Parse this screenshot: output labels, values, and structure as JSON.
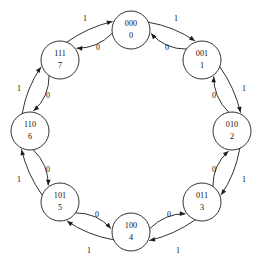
{
  "diagram": {
    "type": "state-transition-diagram",
    "layout": "ring",
    "background_color": "#ffffff",
    "stroke_color": "#1a1a1a",
    "text_color": "#111111",
    "states": [
      {
        "id": "s0",
        "binary": "000",
        "decimal": "0",
        "cx": 131,
        "cy": 30,
        "r": 19
      },
      {
        "id": "s1",
        "binary": "001",
        "decimal": "1",
        "cx": 202,
        "cy": 60,
        "r": 19
      },
      {
        "id": "s2",
        "binary": "010",
        "decimal": "2",
        "cx": 232,
        "cy": 131,
        "r": 19
      },
      {
        "id": "s3",
        "binary": "011",
        "decimal": "3",
        "cx": 202,
        "cy": 202,
        "r": 19
      },
      {
        "id": "s4",
        "binary": "100",
        "decimal": "4",
        "cx": 131,
        "cy": 232,
        "r": 19
      },
      {
        "id": "s5",
        "binary": "101",
        "decimal": "5",
        "cx": 60,
        "cy": 202,
        "r": 19
      },
      {
        "id": "s6",
        "binary": "110",
        "decimal": "6",
        "cx": 30,
        "cy": 131,
        "r": 19
      },
      {
        "id": "s7",
        "binary": "111",
        "decimal": "7",
        "cx": 60,
        "cy": 60,
        "r": 19
      }
    ],
    "transitions": [
      {
        "id": "t0",
        "from": "000",
        "to": "001",
        "input": "1",
        "direction": "clockwise",
        "arc": "outer",
        "label_x": 176,
        "label_y": 19
      },
      {
        "id": "t1",
        "from": "001",
        "to": "010",
        "input": "1",
        "direction": "clockwise",
        "arc": "outer",
        "label_x": 244,
        "label_y": 89
      },
      {
        "id": "t2",
        "from": "010",
        "to": "011",
        "input": "1",
        "direction": "clockwise",
        "arc": "outer",
        "label_x": 244,
        "label_y": 180
      },
      {
        "id": "t3",
        "from": "011",
        "to": "100",
        "input": "1",
        "direction": "clockwise",
        "arc": "outer",
        "label_x": 178,
        "label_y": 251
      },
      {
        "id": "t4",
        "from": "100",
        "to": "101",
        "input": "1",
        "direction": "clockwise",
        "arc": "outer",
        "label_x": 89,
        "label_y": 251
      },
      {
        "id": "t5",
        "from": "101",
        "to": "110",
        "input": "1",
        "direction": "clockwise",
        "arc": "outer",
        "label_x": 19,
        "label_y": 180
      },
      {
        "id": "t6",
        "from": "110",
        "to": "111",
        "input": "1",
        "direction": "clockwise",
        "arc": "outer",
        "label_x": 19,
        "label_y": 89
      },
      {
        "id": "t7",
        "from": "111",
        "to": "000",
        "input": "1",
        "direction": "clockwise",
        "arc": "outer",
        "label_x": 85,
        "label_y": 19
      },
      {
        "id": "t8",
        "from": "001",
        "to": "000",
        "input": "0",
        "direction": "counterclockwise",
        "arc": "inner",
        "label_x": 167,
        "label_y": 48
      },
      {
        "id": "t9",
        "from": "010",
        "to": "001",
        "input": "0",
        "direction": "counterclockwise",
        "arc": "inner",
        "label_x": 214,
        "label_y": 96
      },
      {
        "id": "t10",
        "from": "011",
        "to": "010",
        "input": "0",
        "direction": "counterclockwise",
        "arc": "inner",
        "label_x": 214,
        "label_y": 170
      },
      {
        "id": "t11",
        "from": "100",
        "to": "011",
        "input": "0",
        "direction": "counterclockwise",
        "arc": "inner",
        "label_x": 169,
        "label_y": 215
      },
      {
        "id": "t12",
        "from": "101",
        "to": "100",
        "input": "0",
        "direction": "counterclockwise",
        "arc": "inner",
        "label_x": 97,
        "label_y": 215
      },
      {
        "id": "t13",
        "from": "110",
        "to": "101",
        "input": "0",
        "direction": "counterclockwise",
        "arc": "inner",
        "label_x": 48,
        "label_y": 170
      },
      {
        "id": "t14",
        "from": "111",
        "to": "110",
        "input": "0",
        "direction": "counterclockwise",
        "arc": "inner",
        "label_x": 48,
        "label_y": 96
      },
      {
        "id": "t15",
        "from": "000",
        "to": "111",
        "input": "0",
        "direction": "counterclockwise",
        "arc": "inner",
        "label_x": 98,
        "label_y": 48
      }
    ]
  }
}
